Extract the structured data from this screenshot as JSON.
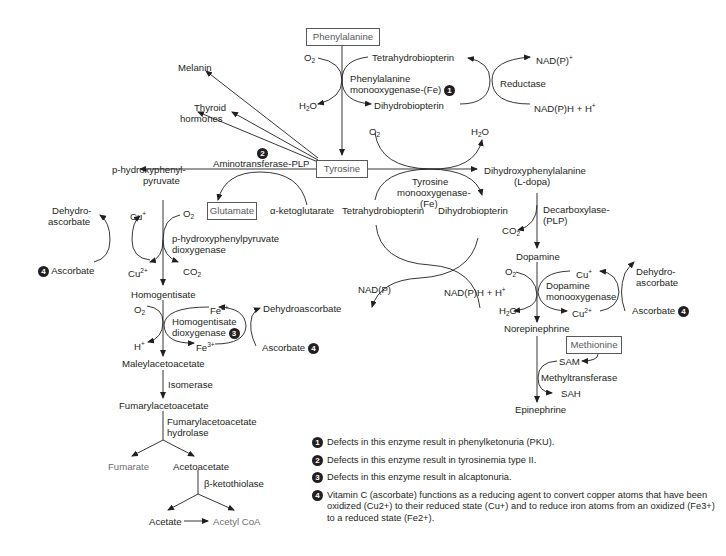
{
  "boxes": {
    "phenylalanine": "Phenylalanine",
    "tyrosine": "Tyrosine",
    "glutamate": "Glutamate",
    "methionine": "Methionine"
  },
  "phe_hydroxylation": {
    "o2": "O2",
    "h2o": "H2O",
    "enzyme_line1": "Phenylalanine",
    "enzyme_line2": "monooxygenase-(Fe)",
    "badge": "1",
    "bh4": "Tetrahydrobiopterin",
    "bh2": "Dihydrobiopterin",
    "reductase": "Reductase",
    "nadp_plus": "NAD(P)+",
    "nadph": "NAD(P)H + H+"
  },
  "tyrosine_products": {
    "melanin": "Melanin",
    "thyroid_line1": "Thyroid",
    "thyroid_line2": "hormones"
  },
  "transamination": {
    "badge": "2",
    "enzyme": "Aminotransferase-PLP",
    "product_line1": "p-hydroxyphenyl-",
    "product_line2": "pyruvate",
    "alpha_kg": "α-ketoglutarate"
  },
  "tyr_hydroxylation": {
    "o2": "O2",
    "h2o": "H2O",
    "enzyme_line1": "Tyrosine",
    "enzyme_line2": "monooxygenase-",
    "enzyme_line3": "(Fe)",
    "bh4": "Tetrahydrobiopterin",
    "bh2": "Dihydrobiopterin",
    "nadp": "NAD(P)",
    "nadph": "NAD(P)H + H+",
    "product_line1": "Dihydroxyphenylalanine",
    "product_line2": "(L-dopa)"
  },
  "catecholamines": {
    "decarboxylase_line1": "Decarboxylase-",
    "decarboxylase_line2": "(PLP)",
    "co2": "CO2",
    "dopamine": "Dopamine",
    "o2": "O2",
    "h2o": "H2O",
    "cu_plus": "Cu+",
    "cu_2plus": "Cu2+",
    "dbh_line1": "Dopamine",
    "dbh_line2": "monooxygenase",
    "dehydro_line1": "Dehydro-",
    "dehydro_line2": "ascorbate",
    "ascorbate": "Ascorbate",
    "badge": "4",
    "norepinephrine": "Norepinephrine",
    "sam": "SAM",
    "sah": "SAH",
    "methyltransferase": "Methyltransferase",
    "epinephrine": "Epinephrine"
  },
  "hppd": {
    "dehydro_line1": "Dehydro-",
    "dehydro_line2": "ascorbate",
    "cu_plus": "Cu+",
    "cu_2plus": "Cu2+",
    "o2": "O2",
    "co2": "CO2",
    "ascorbate": "Ascorbate",
    "badge": "4",
    "enzyme_line1": "p-hydroxyphenylpyruvate",
    "enzyme_line2": "dioxygenase",
    "product": "Homogentisate"
  },
  "hgd": {
    "o2": "O2",
    "h_plus": "H+",
    "fe2": "Fe2+",
    "fe3": "Fe3+",
    "enzyme_line1": "Homogentisate",
    "enzyme_line2": "dioxygenase",
    "badge": "3",
    "dehydroascorbate": "Dehydroascorbate",
    "ascorbate": "Ascorbate",
    "badge4": "4",
    "product": "Maleylacetoacetate"
  },
  "degradation": {
    "isomerase": "Isomerase",
    "fumarylacetoacetate": "Fumarylacetoacetate",
    "faah_line1": "Fumarylacetoacetate",
    "faah_line2": "hydrolase",
    "fumarate": "Fumarate",
    "acetoacetate": "Acetoacetate",
    "thiolase": "β-ketothiolase",
    "acetate": "Acetate",
    "acetyl_coa": "Acetyl CoA"
  },
  "footnotes": [
    {
      "badge": "1",
      "text": "Defects in this enzyme result in phenylketonuria (PKU)."
    },
    {
      "badge": "2",
      "text": "Defects in this enzyme result in tyrosinemia type II."
    },
    {
      "badge": "3",
      "text": "Defects in this enzyme result in alcaptonuria."
    },
    {
      "badge": "4",
      "text": "Vitamin C (ascorbate) functions as a reducing agent to convert copper atoms that have been oxidized (Cu2+) to their reduced state (Cu+) and to reduce iron atoms from an oxidized (Fe3+) to a reduced state (Fe2+)."
    }
  ],
  "colors": {
    "ink": "#231f20",
    "box_border": "#58595b",
    "gray_text": "#6d6e71"
  }
}
